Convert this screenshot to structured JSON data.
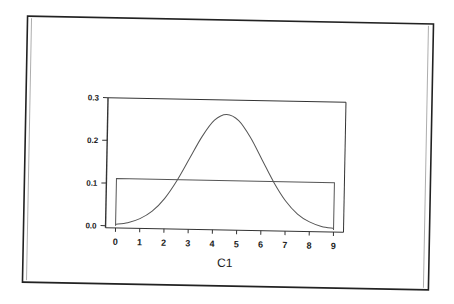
{
  "chart_data": {
    "type": "line",
    "title": "",
    "xlabel": "C1",
    "ylabel": "",
    "xlim": [
      0,
      9
    ],
    "ylim": [
      0,
      0.3
    ],
    "x_ticks": [
      "0",
      "1",
      "2",
      "3",
      "4",
      "5",
      "6",
      "7",
      "8",
      "9"
    ],
    "y_ticks": [
      "0.0",
      "0.1",
      "0.2",
      "0.3"
    ],
    "grid": false,
    "legend": null,
    "series": [
      {
        "name": "normal-density",
        "x": [
          0,
          0.5,
          1,
          1.5,
          2,
          2.5,
          3,
          3.5,
          4,
          4.5,
          5,
          5.5,
          6,
          6.5,
          7,
          7.5,
          8,
          8.5,
          9
        ],
        "values": [
          0.004,
          0.008,
          0.018,
          0.036,
          0.066,
          0.109,
          0.161,
          0.213,
          0.252,
          0.266,
          0.252,
          0.213,
          0.161,
          0.109,
          0.066,
          0.036,
          0.018,
          0.008,
          0.004
        ]
      },
      {
        "name": "uniform-density",
        "x": [
          0,
          0,
          9,
          9
        ],
        "values": [
          0,
          0.111,
          0.111,
          0
        ]
      }
    ],
    "colors": {
      "line": "#555555",
      "axis": "#333333",
      "frame": "#222222",
      "text": "#222222"
    }
  }
}
